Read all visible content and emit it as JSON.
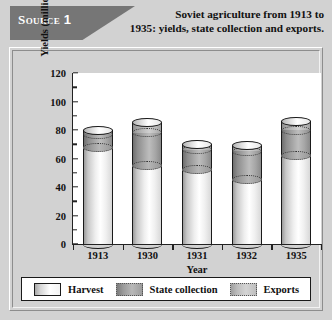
{
  "header": {
    "source_badge": "Source",
    "source_number": "1",
    "title_line1": "Soviet agriculture from 1913 to",
    "title_line2": "1935: yields, state collection and exports."
  },
  "legend": {
    "items": [
      {
        "label": "Harvest",
        "swatch": "harvest",
        "color": "#ffffff"
      },
      {
        "label": "State collection",
        "swatch": "state",
        "color": "#a8a8a8"
      },
      {
        "label": "Exports",
        "swatch": "exports",
        "color": "#cccccc"
      }
    ]
  },
  "chart_data": {
    "type": "bar",
    "title": "Soviet agriculture from 1913 to 1935: yields, state collection and exports.",
    "xlabel": "Year",
    "ylabel": "Yields (millions of tons)",
    "ylim": [
      0,
      120
    ],
    "ytick_major": [
      0,
      20,
      40,
      60,
      80,
      100,
      120
    ],
    "ytick_minor": [
      10,
      30,
      50,
      70,
      90,
      110
    ],
    "ytick_labels": [
      "0",
      "20",
      "40",
      "60",
      "80",
      "100",
      "120"
    ],
    "grid": false,
    "legend_position": "bottom",
    "stacked": true,
    "categories": [
      "1913",
      "1930",
      "1931",
      "1932",
      "1935"
    ],
    "series": [
      {
        "name": "Harvest",
        "values": [
          80,
          85,
          70,
          69,
          86
        ]
      },
      {
        "name": "State collection",
        "values": [
          68,
          55,
          52,
          45,
          62
        ]
      },
      {
        "name": "Exports",
        "values": [
          77,
          78,
          66,
          65,
          80
        ]
      }
    ],
    "bars": [
      {
        "category": "1913",
        "total": 80,
        "state_collection_top": 77,
        "exports_top": 80,
        "harvest_top": 68
      },
      {
        "category": "1930",
        "total": 85,
        "state_collection_top": 78,
        "exports_top": 85,
        "harvest_top": 55
      },
      {
        "category": "1931",
        "total": 70,
        "state_collection_top": 66,
        "exports_top": 70,
        "harvest_top": 52
      },
      {
        "category": "1932",
        "total": 69,
        "state_collection_top": 65,
        "exports_top": 69,
        "harvest_top": 45
      },
      {
        "category": "1935",
        "total": 86,
        "state_collection_top": 80,
        "exports_top": 86,
        "harvest_top": 62
      }
    ]
  }
}
